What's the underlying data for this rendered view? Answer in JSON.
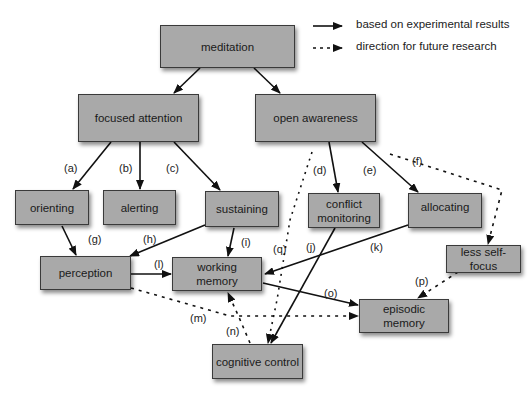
{
  "legend": {
    "solid": "based on experimental results",
    "dashed": "direction for future research"
  },
  "nodes": {
    "meditation": "meditation",
    "focused_attention": "focused attention",
    "open_awareness": "open awareness",
    "orienting": "orienting",
    "alerting": "alerting",
    "sustaining": "sustaining",
    "conflict_monitoring": "conflict monitoring",
    "allocating": "allocating",
    "less_self_focus": "less self-focus",
    "perception": "perception",
    "working_memory": "working memory",
    "episodic_memory": "episodic memory",
    "cognitive_control": "cognitive control"
  },
  "edge_labels": {
    "a": "(a)",
    "b": "(b)",
    "c": "(c)",
    "d": "(d)",
    "e": "(e)",
    "f": "(f)",
    "g": "(g)",
    "h": "(h)",
    "i": "(i)",
    "j": "(j)",
    "k": "(k)",
    "l": "(l)",
    "m": "(m)",
    "n": "(n)",
    "o": "(o)",
    "p": "(p)",
    "q": "(q)"
  },
  "edges": [
    {
      "from": "meditation",
      "to": "focused attention",
      "style": "solid"
    },
    {
      "from": "meditation",
      "to": "open awareness",
      "style": "solid"
    },
    {
      "label": "(a)",
      "from": "focused attention",
      "to": "orienting",
      "style": "solid"
    },
    {
      "label": "(b)",
      "from": "focused attention",
      "to": "alerting",
      "style": "solid"
    },
    {
      "label": "(c)",
      "from": "focused attention",
      "to": "sustaining",
      "style": "solid"
    },
    {
      "label": "(d)",
      "from": "open awareness",
      "to": "conflict monitoring",
      "style": "solid"
    },
    {
      "label": "(e)",
      "from": "open awareness",
      "to": "allocating",
      "style": "solid"
    },
    {
      "label": "(f)",
      "from": "open awareness",
      "to": "less self-focus",
      "style": "dashed"
    },
    {
      "label": "(g)",
      "from": "orienting",
      "to": "perception",
      "style": "solid"
    },
    {
      "label": "(h)",
      "from": "sustaining",
      "to": "perception",
      "style": "solid"
    },
    {
      "label": "(i)",
      "from": "sustaining",
      "to": "working memory",
      "style": "solid"
    },
    {
      "label": "(j)",
      "from": "conflict monitoring",
      "to": "cognitive control",
      "style": "solid"
    },
    {
      "label": "(k)",
      "from": "allocating",
      "to": "working memory",
      "style": "solid"
    },
    {
      "label": "(l)",
      "from": "perception",
      "to": "working memory",
      "style": "solid"
    },
    {
      "label": "(m)",
      "from": "perception",
      "to": "episodic memory",
      "style": "dashed"
    },
    {
      "label": "(n)",
      "from": "cognitive control",
      "to": "working memory",
      "style": "dashed"
    },
    {
      "label": "(o)",
      "from": "working memory",
      "to": "episodic memory",
      "style": "solid"
    },
    {
      "label": "(p)",
      "from": "less self-focus",
      "to": "episodic memory",
      "style": "dashed"
    },
    {
      "label": "(q)",
      "from": "open awareness",
      "to": "cognitive control",
      "style": "dashed"
    }
  ]
}
